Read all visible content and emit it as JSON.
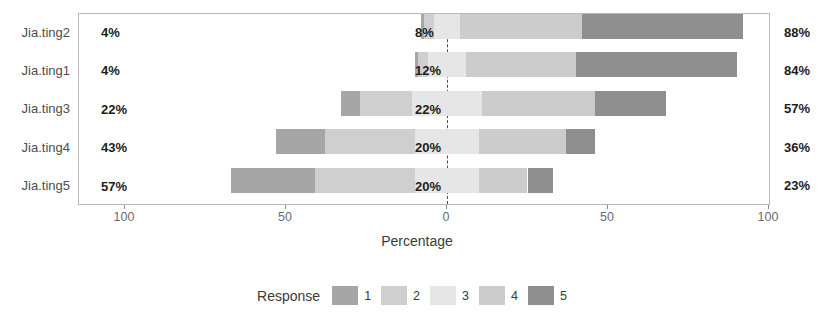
{
  "chart_data": {
    "type": "bar",
    "subtype": "diverging-stacked-likert",
    "title": "",
    "xlabel": "Percentage",
    "ylabel": "",
    "xlim": [
      -114.6,
      114.6
    ],
    "xticks": [
      -100,
      -50,
      0,
      50,
      100
    ],
    "xtick_labels": [
      "100",
      "50",
      "0",
      "50",
      "100"
    ],
    "grid": false,
    "zero_line": true,
    "legend_position": "bottom",
    "legend_title": "Response",
    "categories": [
      "Jia.ting2",
      "Jia.ting1",
      "Jia.ting3",
      "Jia.ting4",
      "Jia.ting5"
    ],
    "series": [
      {
        "name": "1",
        "color": "#a6a6a6",
        "values": [
          1,
          1,
          6,
          15,
          26
        ]
      },
      {
        "name": "2",
        "color": "#cfcfcf",
        "values": [
          3,
          3,
          16,
          28,
          31
        ]
      },
      {
        "name": "3",
        "color": "#e6e6e6",
        "values": [
          8,
          12,
          22,
          20,
          20
        ]
      },
      {
        "name": "4",
        "color": "#cccccc",
        "values": [
          38,
          34,
          35,
          27,
          15
        ]
      },
      {
        "name": "5",
        "color": "#8f8f8f",
        "values": [
          50,
          50,
          22,
          9,
          8
        ]
      }
    ],
    "annotations": {
      "left_labels": [
        "4%",
        "4%",
        "22%",
        "43%",
        "36%"
      ],
      "center_labels": [
        "8%",
        "12%",
        "22%",
        "20%",
        "20%"
      ],
      "right_labels": [
        "88%",
        "84%",
        "57%",
        "36%",
        "23%"
      ]
    },
    "rows": [
      {
        "category": "Jia.ting2",
        "negative_label": "4%",
        "neutral_label": "8%",
        "positive_label": "88%",
        "negative_total": 4,
        "neutral_total": 8,
        "positive_total": 88,
        "segments": [
          {
            "response": "1",
            "value": 1,
            "color": "#a6a6a6"
          },
          {
            "response": "2",
            "value": 3,
            "color": "#cfcfcf"
          },
          {
            "response": "3",
            "value": 8,
            "color": "#e6e6e6"
          },
          {
            "response": "4",
            "value": 38,
            "color": "#cccccc"
          },
          {
            "response": "5",
            "value": 50,
            "color": "#8f8f8f"
          }
        ]
      },
      {
        "category": "Jia.ting1",
        "negative_label": "4%",
        "neutral_label": "12%",
        "positive_label": "84%",
        "negative_total": 4,
        "neutral_total": 12,
        "positive_total": 84,
        "segments": [
          {
            "response": "1",
            "value": 1,
            "color": "#a6a6a6"
          },
          {
            "response": "2",
            "value": 3,
            "color": "#cfcfcf"
          },
          {
            "response": "3",
            "value": 12,
            "color": "#e6e6e6"
          },
          {
            "response": "4",
            "value": 34,
            "color": "#cccccc"
          },
          {
            "response": "5",
            "value": 50,
            "color": "#8f8f8f"
          }
        ]
      },
      {
        "category": "Jia.ting3",
        "negative_label": "22%",
        "neutral_label": "22%",
        "positive_label": "57%",
        "negative_total": 22,
        "neutral_total": 22,
        "positive_total": 57,
        "segments": [
          {
            "response": "1",
            "value": 6,
            "color": "#a6a6a6"
          },
          {
            "response": "2",
            "value": 16,
            "color": "#cfcfcf"
          },
          {
            "response": "3",
            "value": 22,
            "color": "#e6e6e6"
          },
          {
            "response": "4",
            "value": 35,
            "color": "#cccccc"
          },
          {
            "response": "5",
            "value": 22,
            "color": "#8f8f8f"
          }
        ]
      },
      {
        "category": "Jia.ting4",
        "negative_label": "43%",
        "neutral_label": "20%",
        "positive_label": "36%",
        "negative_total": 43,
        "neutral_total": 20,
        "positive_total": 36,
        "segments": [
          {
            "response": "1",
            "value": 15,
            "color": "#a6a6a6"
          },
          {
            "response": "2",
            "value": 28,
            "color": "#cfcfcf"
          },
          {
            "response": "3",
            "value": 20,
            "color": "#e6e6e6"
          },
          {
            "response": "4",
            "value": 27,
            "color": "#cccccc"
          },
          {
            "response": "5",
            "value": 9,
            "color": "#8f8f8f"
          }
        ]
      },
      {
        "category": "Jia.ting5",
        "negative_label": "57%",
        "neutral_label": "20%",
        "positive_label": "23%",
        "negative_total": 57,
        "neutral_total": 20,
        "positive_total": 23,
        "segments": [
          {
            "response": "1",
            "value": 26,
            "color": "#a6a6a6"
          },
          {
            "response": "2",
            "value": 31,
            "color": "#cfcfcf"
          },
          {
            "response": "3",
            "value": 20,
            "color": "#e6e6e6"
          },
          {
            "response": "4",
            "value": 15,
            "color": "#cccccc"
          },
          {
            "response": "5",
            "value": 8,
            "color": "#8f8f8f"
          }
        ]
      }
    ]
  },
  "axis": {
    "x_title": "Percentage",
    "tick_labels": [
      "100",
      "50",
      "0",
      "50",
      "100"
    ],
    "tick_values": [
      -100,
      -50,
      0,
      50,
      100
    ]
  },
  "legend": {
    "title": "Response",
    "items": [
      {
        "key": "1",
        "color": "#a6a6a6"
      },
      {
        "key": "2",
        "color": "#cfcfcf"
      },
      {
        "key": "3",
        "color": "#e6e6e6"
      },
      {
        "key": "4",
        "color": "#cccccc"
      },
      {
        "key": "5",
        "color": "#8f8f8f"
      }
    ]
  },
  "style": {
    "panel_border": "#b9b9b9",
    "zero_line_color": "#4a4a4a",
    "label_color": "#1d1d1d",
    "axis_text_color": "#6b6b6b"
  }
}
